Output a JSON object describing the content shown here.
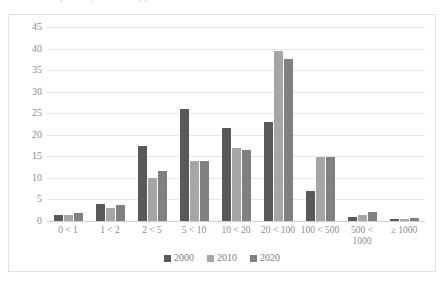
{
  "caption": {
    "clipped_text": "partially visible clipped text above chart"
  },
  "legend": {
    "position": "bottom-center",
    "items": [
      {
        "label": "2000",
        "color": "#595959"
      },
      {
        "label": "2010",
        "color": "#a6a6a6"
      },
      {
        "label": "2020",
        "color": "#808080"
      }
    ]
  },
  "axis": {
    "y_ticks": [
      "45",
      "40",
      "35",
      "30",
      "25",
      "20",
      "15",
      "10",
      "5",
      "0"
    ]
  },
  "chart_data": {
    "type": "bar",
    "title": "",
    "subtitle": "",
    "xlabel": "",
    "ylabel": "",
    "ylim": [
      0,
      45
    ],
    "ytick_step": 5,
    "grid": true,
    "legend_position": "bottom-center",
    "categories": [
      "0 < 1",
      "1 < 2",
      "2 < 5",
      "5 < 10",
      "10 < 20",
      "20 < 100",
      "100 < 500",
      "500 < 1000",
      "≥ 1000"
    ],
    "series": [
      {
        "name": "2000",
        "color": "#595959",
        "values": [
          1.5,
          4.0,
          17.5,
          26.0,
          21.5,
          23.0,
          7.0,
          1.0,
          0.5
        ]
      },
      {
        "name": "2010",
        "color": "#a6a6a6",
        "values": [
          1.3,
          3.0,
          10.0,
          14.0,
          17.0,
          39.5,
          14.8,
          1.5,
          0.5
        ]
      },
      {
        "name": "2020",
        "color": "#808080",
        "values": [
          1.8,
          3.8,
          11.5,
          14.0,
          16.5,
          37.5,
          14.8,
          2.0,
          0.6
        ]
      }
    ]
  }
}
